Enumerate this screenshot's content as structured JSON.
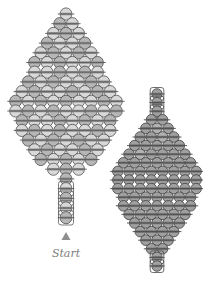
{
  "page": {
    "background": "#ffffff",
    "width": 203,
    "height": 283
  },
  "start_label": {
    "text": "Start",
    "color": "#7d7d7d",
    "x": 66,
    "y": 257
  },
  "start_marker": {
    "shape": "triangle-up",
    "color": "#8f8f8f",
    "tip_x": 66,
    "tip_y": 232,
    "half_width": 4.5,
    "height": 8
  },
  "leaves": [
    {
      "id": "large-leaf",
      "cx": 66,
      "start_y": 14,
      "bead": {
        "w": 12.6,
        "h": 12.2,
        "pitch": 9.7
      },
      "colors": {
        "L": "#d8d8d8",
        "D": "#b6b6b6",
        "stroke": "#4c4c4c",
        "band": "#909090",
        "thread": "#5a5a5a"
      },
      "rows": [
        "L",
        "DL",
        "LDL",
        "DLLD",
        "LDLDL",
        "DLDLLD",
        "LLDLDL",
        "DLDLLDL",
        "LDLLDLDL",
        "DLDLDLLDL",
        "LDLDLLDLD",
        "DLLDLDLD",
        "LDLDLLDL",
        "DLDLDLL",
        "LDLLDL",
        "DLDLD",
        "LDL",
        "D",
        "L",
        "D",
        "L",
        "D"
      ],
      "outline_rows": [
        18,
        19,
        20,
        21
      ]
    },
    {
      "id": "small-leaf",
      "cx": 157,
      "start_y": 94,
      "bead": {
        "w": 11.2,
        "h": 10.6,
        "pitch": 8.6
      },
      "colors": {
        "L": "#b2b2b2",
        "D": "#a0a0a0",
        "stroke": "#3d3d3d",
        "band": "#787878",
        "thread": "#4a4a4a"
      },
      "rows": [
        "D",
        "D",
        "D",
        "DD",
        "DLD",
        "DDLD",
        "DDDDD",
        "DLDDDD",
        "DDDDDDD",
        "DDDDDDDD",
        "DDDDDDDD",
        "DDDDDDDD",
        "DDDDDDD",
        "DDDDDDD",
        "DDDDDD",
        "DDDDD",
        "DDDD",
        "DDD",
        "DD",
        "D",
        "D"
      ],
      "outline_rows": [
        0,
        1,
        2,
        19,
        20
      ]
    }
  ]
}
